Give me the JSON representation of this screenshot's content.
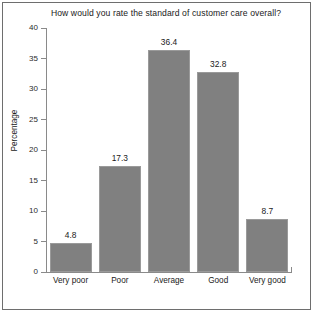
{
  "chart_data": {
    "type": "bar",
    "title": "How would you rate the standard of customer care overall?",
    "xlabel": "",
    "ylabel": "Percentage",
    "categories": [
      "Very poor",
      "Poor",
      "Average",
      "Good",
      "Very good"
    ],
    "values": [
      4.8,
      17.3,
      36.4,
      32.8,
      8.7
    ],
    "value_labels": [
      "4.8",
      "17.3",
      "36.4",
      "32.8",
      "8.7"
    ],
    "ylim": [
      0,
      40
    ],
    "ytick_labels": [
      "0",
      "5",
      "10",
      "15",
      "20",
      "25",
      "30",
      "35",
      "40"
    ],
    "ytick_values": [
      0,
      5,
      10,
      15,
      20,
      25,
      30,
      35,
      40
    ],
    "grid": false,
    "legend": false,
    "bar_color": "#808080",
    "axis_color": "#8a8a8a",
    "text_color": "#1a1a1a",
    "frame_color": "#6e6e6e",
    "background": "#ffffff"
  }
}
